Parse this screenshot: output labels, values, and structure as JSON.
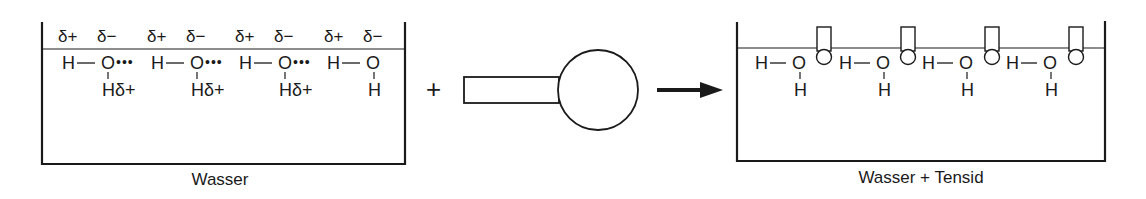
{
  "diagram": {
    "left_panel": {
      "label": "Wasser",
      "charges": [
        "δ+",
        "δ−",
        "δ+",
        "δ−",
        "δ+",
        "δ−",
        "δ+",
        "δ−"
      ],
      "molecules": [
        {
          "h_left": "H",
          "bond": "—",
          "o": "O",
          "h_bottom": "Hδ+",
          "hbond": "•••"
        },
        {
          "h_left": "H",
          "bond": "—",
          "o": "O",
          "h_bottom": "Hδ+",
          "hbond": "•••"
        },
        {
          "h_left": "H",
          "bond": "—",
          "o": "O",
          "h_bottom": "Hδ+",
          "hbond": "•••"
        },
        {
          "h_left": "H",
          "bond": "—",
          "o": "O",
          "h_bottom": "H",
          "hbond": ""
        }
      ]
    },
    "operator_plus": "+",
    "tensid_label_icon": "surfactant-molecule-icon",
    "arrow_icon": "right-arrow-icon",
    "right_panel": {
      "label": "Wasser + Tensid",
      "molecules": [
        {
          "h_left": "H",
          "bond": "—",
          "o": "O",
          "h_bottom": "H"
        },
        {
          "h_left": "H",
          "bond": "—",
          "o": "O",
          "h_bottom": "H"
        },
        {
          "h_left": "H",
          "bond": "—",
          "o": "O",
          "h_bottom": "H"
        },
        {
          "h_left": "H",
          "bond": "—",
          "o": "O",
          "h_bottom": "H"
        }
      ],
      "tensid_count": 4
    },
    "colors": {
      "ink": "#1a1a1a",
      "background": "#ffffff"
    }
  }
}
